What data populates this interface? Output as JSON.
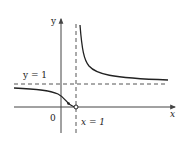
{
  "figure": {
    "type": "function-graph",
    "labels": {
      "y_axis": "y",
      "x_axis": "x",
      "origin": "0",
      "horizontal_asymptote": "y = 1",
      "vertical_asymptote": "x = 1"
    },
    "asymptotes": {
      "horizontal": {
        "equation": "y = 1",
        "value": 1
      },
      "vertical": {
        "equation": "x = 1",
        "value": 1
      }
    },
    "points": [
      {
        "name": "open-circle",
        "x": 1,
        "y": 0,
        "style": "open"
      },
      {
        "name": "filled-point",
        "x": 0.5,
        "y": 0.05,
        "style": "filled"
      }
    ],
    "colors": {
      "curve": "#222222",
      "axes": "#444444",
      "dashed": "#555555"
    }
  }
}
